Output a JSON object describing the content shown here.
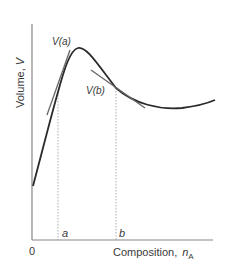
{
  "figure": {
    "y_axis_label": "Volume,",
    "y_axis_symbol": "V",
    "x_axis_label": "Composition,",
    "x_axis_symbol": "n",
    "x_axis_subscript": "A",
    "origin_label": "0",
    "marker_a": "a",
    "marker_b": "b",
    "label_va": "V(a)",
    "label_vb": "V(b)"
  },
  "colors": {
    "axis": "#888888",
    "curve": "#2a2a2a",
    "tangent": "#666666",
    "dotted": "#9a9a9a",
    "text": "#3a3a3a"
  }
}
